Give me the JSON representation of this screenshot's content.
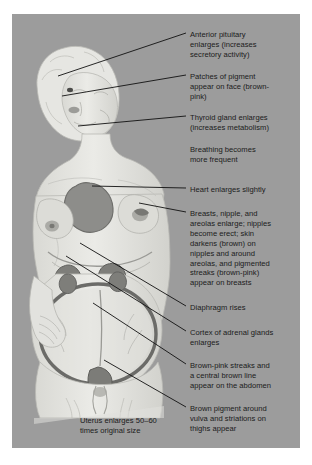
{
  "figure": {
    "panel_color": "#9c9c9c",
    "body_color": "#e3e3df",
    "organ_color": "#8a8a8a",
    "line_color": "#111111"
  },
  "labels": [
    {
      "id": "anterior-pituitary",
      "text": "Anterior pituitary\nenlarges (increases\nsecretory activity)",
      "x": 190,
      "y": 30,
      "leader": {
        "x1": 186,
        "y1": 33,
        "x2": 58,
        "y2": 76
      }
    },
    {
      "id": "face-pigment",
      "text": "Patches of pigment\nappear on face (brown-\npink)",
      "x": 190,
      "y": 72,
      "leader": {
        "x1": 186,
        "y1": 75,
        "x2": 62,
        "y2": 96
      }
    },
    {
      "id": "thyroid-gland",
      "text": "Thyroid gland enlarges\n(increases metabolism)",
      "x": 190,
      "y": 113,
      "leader": {
        "x1": 186,
        "y1": 116,
        "x2": 78,
        "y2": 126
      }
    },
    {
      "id": "breathing",
      "text": "Breathing becomes\nmore frequent",
      "x": 190,
      "y": 145,
      "leader": null
    },
    {
      "id": "heart",
      "text": "Heart enlarges slightly",
      "x": 190,
      "y": 185,
      "leader": {
        "x1": 186,
        "y1": 188,
        "x2": 92,
        "y2": 186
      }
    },
    {
      "id": "breasts",
      "text": "Breasts, nipple, and\nareolas enlarge; nipples\nbecome erect; skin\ndarkens (brown) on\nnipples and around\nareolas, and pigmented\nstreaks (brown-pink)\nappear on breasts",
      "x": 190,
      "y": 209,
      "leader": {
        "x1": 186,
        "y1": 212,
        "x2": 139,
        "y2": 203
      }
    },
    {
      "id": "diaphragm",
      "text": "Diaphragm rises",
      "x": 190,
      "y": 303,
      "leader": {
        "x1": 186,
        "y1": 306,
        "x2": 80,
        "y2": 243
      }
    },
    {
      "id": "adrenal-cortex",
      "text": "Cortex of adrenal glands\nenlarges",
      "x": 190,
      "y": 328,
      "leader": {
        "x1": 186,
        "y1": 331,
        "x2": 66,
        "y2": 256
      }
    },
    {
      "id": "abdomen-streaks",
      "text": "Brown-pink streaks and\na central brown line\nappear on the abdomen",
      "x": 190,
      "y": 361,
      "leader": {
        "x1": 186,
        "y1": 364,
        "x2": 93,
        "y2": 303
      }
    },
    {
      "id": "vulva-thighs",
      "text": "Brown pigment around\nvulva and striations on\nthighs appear",
      "x": 190,
      "y": 404,
      "leader": {
        "x1": 186,
        "y1": 407,
        "x2": 104,
        "y2": 360
      }
    }
  ],
  "caption": {
    "id": "uterus-caption",
    "text": "Uterus enlarges 50–60\ntimes original size",
    "x": 80,
    "y": 416
  }
}
